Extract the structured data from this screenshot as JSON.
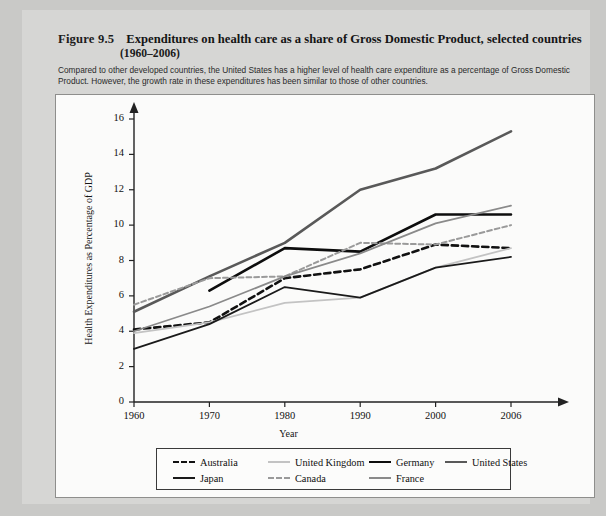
{
  "figure": {
    "label": "Figure 9.5",
    "title": "Expenditures on health care as a share of Gross Domestic Product, selected countries",
    "subtitle": "(1960–2006)",
    "caption": "Compared to other developed countries, the United States has a higher level of health care expenditure as a percentage of Gross Domestic Product. However, the growth rate in these expenditures has been similar to those of other countries."
  },
  "chart_data": {
    "type": "line",
    "title": "Expenditures on health care as a share of Gross Domestic Product, selected countries (1960–2006)",
    "xlabel": "Year",
    "ylabel": "Health Expenditures as Percentage of GDP",
    "x": [
      1960,
      1970,
      1980,
      1990,
      2000,
      2006
    ],
    "xticklabels": [
      "1960",
      "1970",
      "1980",
      "1990",
      "2000",
      "2006"
    ],
    "yticklabels": [
      "0",
      "2",
      "4",
      "6",
      "8",
      "10",
      "12",
      "14",
      "16"
    ],
    "yticks": [
      0,
      2,
      4,
      6,
      8,
      10,
      12,
      14,
      16
    ],
    "xlim": [
      1960,
      2006
    ],
    "ylim": [
      0,
      16
    ],
    "grid": false,
    "legend_position": "below-axes",
    "series": [
      {
        "name": "Australia",
        "color": "#111111",
        "style": "dashed",
        "width": 2.6,
        "x": [
          1960,
          1970,
          1980,
          1990,
          2000,
          2006
        ],
        "values": [
          4.1,
          4.5,
          7.0,
          7.5,
          8.9,
          8.7
        ]
      },
      {
        "name": "United Kingdom",
        "color": "#c3c3c3",
        "style": "solid",
        "width": 1.8,
        "x": [
          1960,
          1970,
          1980,
          1990,
          2000,
          2006
        ],
        "values": [
          3.9,
          4.5,
          5.6,
          5.9,
          7.6,
          8.7
        ]
      },
      {
        "name": "Germany",
        "color": "#0d0d0d",
        "style": "solid",
        "width": 2.6,
        "x": [
          1970,
          1980,
          1990,
          2000,
          2006
        ],
        "values": [
          6.3,
          8.7,
          8.5,
          10.6,
          10.6
        ]
      },
      {
        "name": "United States",
        "color": "#595959",
        "style": "solid",
        "width": 2.6,
        "x": [
          1960,
          1970,
          1980,
          1990,
          2000,
          2006
        ],
        "values": [
          5.1,
          7.1,
          9.0,
          12.0,
          13.2,
          15.3
        ]
      },
      {
        "name": "Japan",
        "color": "#1a1a1a",
        "style": "solid",
        "width": 1.8,
        "x": [
          1960,
          1970,
          1980,
          1990,
          2000,
          2006
        ],
        "values": [
          3.0,
          4.4,
          6.5,
          5.9,
          7.6,
          8.2
        ]
      },
      {
        "name": "Canada",
        "color": "#9a9a9a",
        "style": "dashed",
        "width": 2.0,
        "x": [
          1960,
          1970,
          1980,
          1990,
          2000,
          2006
        ],
        "values": [
          5.5,
          7.0,
          7.1,
          9.0,
          8.9,
          10.0
        ]
      },
      {
        "name": "France",
        "color": "#8a8a8a",
        "style": "solid",
        "width": 1.8,
        "x": [
          1960,
          1970,
          1980,
          1990,
          2000,
          2006
        ],
        "values": [
          4.0,
          5.4,
          7.1,
          8.4,
          10.1,
          11.1
        ]
      }
    ]
  }
}
